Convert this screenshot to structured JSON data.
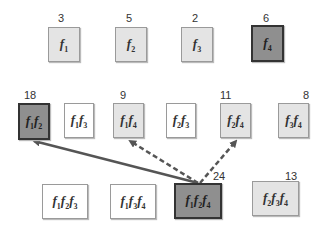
{
  "diagram": {
    "singletons": [
      {
        "id": "f1",
        "subs": [
          "1"
        ],
        "count": "3",
        "shade": "l",
        "x": 48,
        "y": 27,
        "w": 32,
        "h": 35,
        "cx": 58,
        "cy": 12
      },
      {
        "id": "f2",
        "subs": [
          "2"
        ],
        "count": "5",
        "shade": "l",
        "x": 115,
        "y": 27,
        "w": 32,
        "h": 35,
        "cx": 126,
        "cy": 12
      },
      {
        "id": "f3",
        "subs": [
          "3"
        ],
        "count": "2",
        "shade": "l",
        "x": 181,
        "y": 27,
        "w": 32,
        "h": 35,
        "cx": 192,
        "cy": 12
      },
      {
        "id": "f4",
        "subs": [
          "4"
        ],
        "count": "6",
        "shade": "d",
        "x": 251,
        "y": 25,
        "w": 33,
        "h": 37,
        "cx": 263,
        "cy": 12
      }
    ],
    "pairs": [
      {
        "id": "f1f2",
        "subs": [
          "1",
          "2"
        ],
        "count": "18",
        "shade": "d",
        "x": 18,
        "y": 103,
        "w": 32,
        "h": 37,
        "cx": 24,
        "cy": 89
      },
      {
        "id": "f1f3",
        "subs": [
          "1",
          "3"
        ],
        "count": "",
        "shade": "w",
        "x": 64,
        "y": 103,
        "w": 30,
        "h": 35
      },
      {
        "id": "f1f4",
        "subs": [
          "1",
          "4"
        ],
        "count": "9",
        "shade": "l",
        "x": 113,
        "y": 103,
        "w": 31,
        "h": 35,
        "cx": 120,
        "cy": 89
      },
      {
        "id": "f2f3",
        "subs": [
          "2",
          "3"
        ],
        "count": "",
        "shade": "w",
        "x": 166,
        "y": 103,
        "w": 30,
        "h": 35
      },
      {
        "id": "f2f4",
        "subs": [
          "2",
          "4"
        ],
        "count": "11",
        "shade": "l",
        "x": 220,
        "y": 103,
        "w": 31,
        "h": 35,
        "cx": 220,
        "cy": 89
      },
      {
        "id": "f3f4",
        "subs": [
          "3",
          "4"
        ],
        "count": "8",
        "shade": "l",
        "x": 278,
        "y": 103,
        "w": 31,
        "h": 35,
        "cx": 303,
        "cy": 89
      }
    ],
    "triples": [
      {
        "id": "f1f2f3",
        "subs": [
          "1",
          "2",
          "3"
        ],
        "count": "",
        "shade": "w",
        "x": 42,
        "y": 184,
        "w": 46,
        "h": 35
      },
      {
        "id": "f1f3f4",
        "subs": [
          "1",
          "3",
          "4"
        ],
        "count": "",
        "shade": "w",
        "x": 110,
        "y": 184,
        "w": 46,
        "h": 35
      },
      {
        "id": "f1f2f4",
        "subs": [
          "1",
          "2",
          "4"
        ],
        "count": "24",
        "shade": "d",
        "x": 174,
        "y": 183,
        "w": 48,
        "h": 36,
        "cx": 213,
        "cy": 170
      },
      {
        "id": "f2f3f4",
        "subs": [
          "2",
          "3",
          "4"
        ],
        "count": "13",
        "shade": "l",
        "x": 252,
        "y": 181,
        "w": 47,
        "h": 35,
        "cx": 285,
        "cy": 170
      }
    ],
    "arrows": [
      {
        "from": "f1f2f4",
        "to": "f1f2",
        "style": "solid",
        "x1": 198,
        "y1": 183,
        "x2": 34,
        "y2": 141
      },
      {
        "from": "f1f2f4",
        "to": "f1f4",
        "style": "dashed",
        "x1": 198,
        "y1": 183,
        "x2": 130,
        "y2": 141
      },
      {
        "from": "f1f2f4",
        "to": "f2f4",
        "style": "dashed",
        "x1": 200,
        "y1": 183,
        "x2": 236,
        "y2": 141
      }
    ]
  }
}
